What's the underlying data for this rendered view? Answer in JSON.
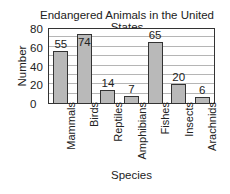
{
  "chart_data": {
    "type": "bar",
    "title": "Endangered Animals in the United States",
    "xlabel": "Species",
    "ylabel": "Number",
    "categories": [
      "Mammals",
      "Birds",
      "Reptiles",
      "Amphibians",
      "Fishes",
      "Insects",
      "Arachnids"
    ],
    "values": [
      55,
      74,
      14,
      7,
      65,
      20,
      6
    ],
    "data_labels": [
      "55",
      "74",
      "14",
      "7",
      "65",
      "20",
      "6"
    ],
    "ylim": [
      0,
      80
    ],
    "yticks": [
      "0",
      "20",
      "40",
      "60",
      "80"
    ],
    "grid": true,
    "grid_step": 10,
    "legend": null,
    "bar_color": "#b9b9b9"
  }
}
